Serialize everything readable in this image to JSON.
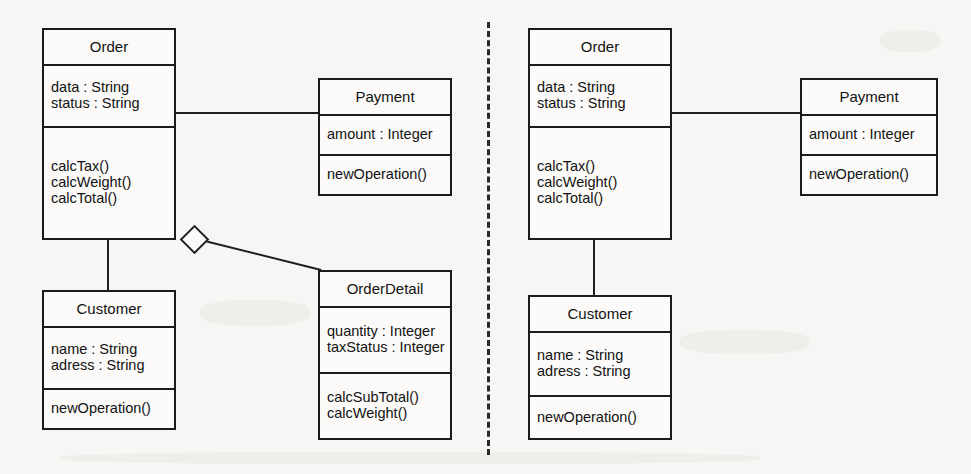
{
  "diagram": {
    "type": "uml-class-diagram",
    "panels": [
      {
        "id": "left",
        "name": "left-diagram",
        "classes": [
          {
            "id": "order",
            "name": "Order",
            "attributes": [
              "data : String",
              "status : String"
            ],
            "operations": [
              "calcTax()",
              "calcWeight()",
              "calcTotal()"
            ],
            "box": {
              "x": 42,
              "y": 28,
              "w": 134,
              "h": 212
            },
            "sections": {
              "name_h": 34,
              "attr_h": 62
            }
          },
          {
            "id": "payment",
            "name": "Payment",
            "attributes": [
              "amount : Integer"
            ],
            "operations": [
              "newOperation()"
            ],
            "box": {
              "x": 318,
              "y": 78,
              "w": 134,
              "h": 118
            },
            "sections": {
              "name_h": 34,
              "attr_h": 40
            }
          },
          {
            "id": "customer",
            "name": "Customer",
            "attributes": [
              "name : String",
              "adress : String"
            ],
            "operations": [
              "newOperation()"
            ],
            "box": {
              "x": 42,
              "y": 290,
              "w": 134,
              "h": 140
            },
            "sections": {
              "name_h": 34,
              "attr_h": 62
            }
          },
          {
            "id": "orderdetail",
            "name": "OrderDetail",
            "attributes": [
              "quantity : Integer",
              "taxStatus : Integer"
            ],
            "operations": [
              "calcSubTotal()",
              "calcWeight()"
            ],
            "box": {
              "x": 318,
              "y": 270,
              "w": 134,
              "h": 170
            },
            "sections": {
              "name_h": 34,
              "attr_h": 66
            }
          }
        ],
        "connectors": [
          {
            "id": "order-payment",
            "kind": "association",
            "from": "Order",
            "to": "Payment"
          },
          {
            "id": "order-customer",
            "kind": "association",
            "from": "Order",
            "to": "Customer"
          },
          {
            "id": "order-orderdetail",
            "kind": "aggregation",
            "from": "Order",
            "to": "OrderDetail"
          }
        ]
      },
      {
        "id": "right",
        "name": "right-diagram",
        "classes": [
          {
            "id": "order",
            "name": "Order",
            "attributes": [
              "data : String",
              "status : String"
            ],
            "operations": [
              "calcTax()",
              "calcWeight()",
              "calcTotal()"
            ],
            "box": {
              "x": 528,
              "y": 28,
              "w": 144,
              "h": 212
            },
            "sections": {
              "name_h": 34,
              "attr_h": 62
            }
          },
          {
            "id": "payment",
            "name": "Payment",
            "attributes": [
              "amount : Integer"
            ],
            "operations": [
              "newOperation()"
            ],
            "box": {
              "x": 800,
              "y": 78,
              "w": 138,
              "h": 118
            },
            "sections": {
              "name_h": 34,
              "attr_h": 40
            }
          },
          {
            "id": "customer",
            "name": "Customer",
            "attributes": [
              "name : String",
              "adress : String"
            ],
            "operations": [
              "newOperation()"
            ],
            "box": {
              "x": 528,
              "y": 295,
              "w": 144,
              "h": 145
            },
            "sections": {
              "name_h": 34,
              "attr_h": 64
            }
          }
        ],
        "connectors": [
          {
            "id": "order-payment",
            "kind": "association",
            "from": "Order",
            "to": "Payment"
          },
          {
            "id": "order-customer",
            "kind": "association",
            "from": "Order",
            "to": "Customer"
          }
        ]
      }
    ],
    "separator": {
      "kind": "dashed-vertical-line",
      "x": 487,
      "y_start": 22,
      "y_end": 455
    },
    "colors": {
      "background": "#f7f6f4",
      "box_fill": "#fbfaf8",
      "stroke": "#1b1b1b",
      "text": "#121212"
    }
  }
}
